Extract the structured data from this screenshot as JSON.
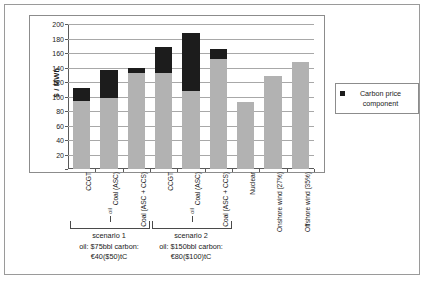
{
  "chart_data": {
    "type": "bar",
    "title": "",
    "xlabel": "",
    "ylabel": "$ / MWh",
    "ylim": [
      0,
      200
    ],
    "ytick_step": 20,
    "yticks": [
      0,
      20,
      40,
      60,
      80,
      100,
      120,
      140,
      160,
      180,
      200
    ],
    "yticklabels": [
      "",
      "20",
      "40",
      "60",
      "80",
      "100",
      "120",
      "140",
      "160",
      "180",
      "200"
    ],
    "grid": true,
    "stacked": true,
    "legend": {
      "position": "right",
      "entries": [
        {
          "label": "Carbon price component",
          "color": "#1c1c1c"
        }
      ]
    },
    "categories": [
      "CCGT",
      "Coal (ASC)",
      "Coal (ASC + CCS)",
      "CCGT",
      "Coal (ASC)",
      "Coal (ASC + CCS)",
      "Nuclear",
      "Onshore wind (27%)",
      "Offshore wind (35%)"
    ],
    "series": [
      {
        "name": "Base cost component",
        "color": "#b2b2b2",
        "values": [
          94,
          98,
          133,
          132,
          107,
          152,
          92,
          128,
          148
        ]
      },
      {
        "name": "Carbon price component",
        "color": "#1c1c1c",
        "values": [
          18,
          38,
          6,
          36,
          81,
          13,
          0,
          0,
          0
        ]
      }
    ],
    "totals": [
      112,
      136,
      139,
      168,
      188,
      165,
      92,
      128,
      148
    ],
    "annotations": [
      {
        "name": "scenario-1",
        "bracket_categories": [
          0,
          1,
          2
        ],
        "lines": [
          "scenario 1",
          "oil: $75bbl carbon:",
          "€40($50)tC"
        ],
        "marker": "oil"
      },
      {
        "name": "scenario-2",
        "bracket_categories": [
          3,
          4,
          5
        ],
        "lines": [
          "scenario 2",
          "oil: $150bbl carbon:",
          "€80($100)tC"
        ],
        "marker": "oil"
      }
    ]
  }
}
